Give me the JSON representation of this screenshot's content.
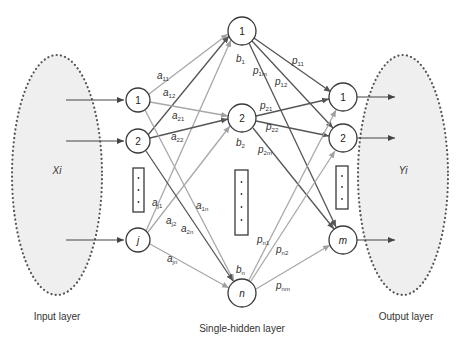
{
  "diagram": {
    "type": "neural-network",
    "colors": {
      "ellipse_fill": "#efefef",
      "edge_dark": "#555555",
      "edge_light": "#a8a8a8",
      "node_stroke": "#3a3a3a"
    },
    "input_layer": {
      "label": "Input layer",
      "set_label": "Xi",
      "nodes": [
        "1",
        "2",
        "j"
      ]
    },
    "hidden_layer": {
      "label": "Single-hidden layer",
      "nodes": [
        "1",
        "2",
        "n"
      ],
      "biases": [
        {
          "base": "b",
          "sub": "1"
        },
        {
          "base": "b",
          "sub": "2"
        },
        {
          "base": "b",
          "sub": "n"
        }
      ]
    },
    "output_layer": {
      "label": "Output layer",
      "set_label": "Yi",
      "nodes": [
        "1",
        "2",
        "m"
      ]
    },
    "input_weights": [
      {
        "base": "a",
        "sub": "11"
      },
      {
        "base": "a",
        "sub": "12"
      },
      {
        "base": "a",
        "sub": "21"
      },
      {
        "base": "a",
        "sub": "22"
      },
      {
        "base": "a",
        "sub": "j1"
      },
      {
        "base": "a",
        "sub": "j2"
      },
      {
        "base": "a",
        "sub": "2n"
      },
      {
        "base": "a",
        "sub": "1n"
      },
      {
        "base": "a",
        "sub": "jn"
      }
    ],
    "output_weights": [
      {
        "base": "p",
        "sub": "11"
      },
      {
        "base": "p",
        "sub": "1m"
      },
      {
        "base": "p",
        "sub": "12"
      },
      {
        "base": "p",
        "sub": "21"
      },
      {
        "base": "p",
        "sub": "22"
      },
      {
        "base": "p",
        "sub": "2m"
      },
      {
        "base": "p",
        "sub": "n1"
      },
      {
        "base": "p",
        "sub": "n2"
      },
      {
        "base": "p",
        "sub": "nm"
      }
    ]
  }
}
